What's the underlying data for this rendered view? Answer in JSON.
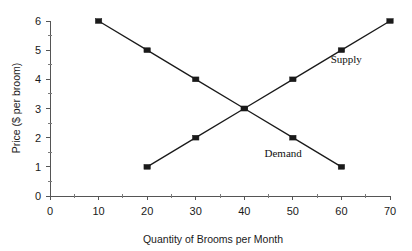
{
  "chart_data": {
    "type": "line",
    "title": "",
    "xlabel": "Quantity of Brooms per Month",
    "ylabel": "Price ($ per broom)",
    "xlim": [
      0,
      70
    ],
    "ylim": [
      0,
      6
    ],
    "xticks": [
      0,
      10,
      20,
      30,
      40,
      50,
      60,
      70
    ],
    "yticks": [
      0,
      1,
      2,
      3,
      4,
      5,
      6
    ],
    "xtick_labels": [
      "0",
      "10",
      "20",
      "30",
      "40",
      "50",
      "60",
      "70"
    ],
    "ytick_labels": [
      "0",
      "1",
      "2",
      "3",
      "4",
      "5",
      "6"
    ],
    "xminor_step": 5,
    "yminor_step": 0.5,
    "grid": false,
    "legend_position": "inline-annotation",
    "series": [
      {
        "name": "Demand",
        "label": "Demand",
        "color": "#1a1a1a",
        "marker": "square",
        "x": [
          10,
          20,
          30,
          40,
          50,
          60
        ],
        "y": [
          6,
          5,
          4,
          3,
          2,
          1
        ],
        "label_x": 48,
        "label_y": 1.35
      },
      {
        "name": "Supply",
        "label": "Supply",
        "color": "#1a1a1a",
        "marker": "square",
        "x": [
          20,
          30,
          40,
          50,
          60,
          70
        ],
        "y": [
          1,
          2,
          3,
          4,
          5,
          6
        ],
        "label_x": 61,
        "label_y": 4.55
      }
    ],
    "equilibrium": {
      "quantity": 40,
      "price": 3
    },
    "annotations": [
      {
        "text": "Supply",
        "x": 61,
        "y": 4.55
      },
      {
        "text": "Demand",
        "x": 48,
        "y": 1.35
      }
    ]
  }
}
